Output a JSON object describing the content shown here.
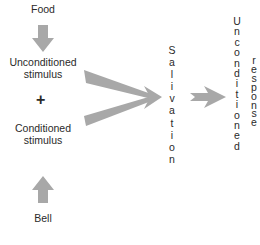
{
  "diagram": {
    "food": "Food",
    "unconditioned_stimulus": [
      "Unconditioned",
      "stimulus"
    ],
    "plus": "+",
    "conditioned_stimulus": [
      "Conditioned",
      "stimulus"
    ],
    "bell": "Bell",
    "salivation": "Salivation",
    "unconditioned": "Unconditioned",
    "response": "response",
    "arrow_color": "#a8a8a8"
  }
}
